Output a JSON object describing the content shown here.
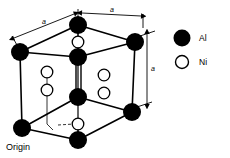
{
  "figure": {
    "title_text": "",
    "origin_label": "Origin",
    "colors": {
      "al_fill": "#000000",
      "ni_fill": "#ffffff",
      "stroke": "#000000",
      "background": "#ffffff"
    },
    "dimension_labels": {
      "top_left": "a",
      "top_right": "a",
      "right_vertical": "a"
    },
    "legend": {
      "items": [
        {
          "symbol": "filled-circle",
          "label": "Al"
        },
        {
          "symbol": "open-circle",
          "label": "Ni"
        }
      ]
    },
    "atoms": {
      "al_label": "Al",
      "ni_label": "Ni",
      "al_positions": [
        {
          "name": "corner-back-left",
          "x": 20,
          "y": 52
        },
        {
          "name": "corner-back-top",
          "x": 78,
          "y": 25
        },
        {
          "name": "corner-back-right",
          "x": 135,
          "y": 42
        },
        {
          "name": "corner-front-left",
          "x": 22,
          "y": 128
        },
        {
          "name": "corner-front-bottom",
          "x": 78,
          "y": 140
        },
        {
          "name": "corner-front-right",
          "x": 132,
          "y": 112
        },
        {
          "name": "center-upper",
          "x": 78,
          "y": 57
        },
        {
          "name": "center-lower",
          "x": 78,
          "y": 97
        }
      ],
      "ni_positions": [
        {
          "name": "ni-top-center",
          "x": 78,
          "y": 42
        },
        {
          "name": "ni-left-upper",
          "x": 47,
          "y": 72
        },
        {
          "name": "ni-left-lower",
          "x": 47,
          "y": 90
        },
        {
          "name": "ni-right-upper",
          "x": 104,
          "y": 75
        },
        {
          "name": "ni-right-lower",
          "x": 104,
          "y": 93
        },
        {
          "name": "ni-bottom-center",
          "x": 78,
          "y": 124
        }
      ]
    }
  }
}
